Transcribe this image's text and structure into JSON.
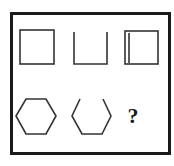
{
  "puzzle": {
    "question_mark": "?",
    "row1": [
      {
        "shape": "square",
        "variant": "closed"
      },
      {
        "shape": "square",
        "variant": "open-top"
      },
      {
        "shape": "square",
        "variant": "inner-left-line"
      }
    ],
    "row2": [
      {
        "shape": "hexagon",
        "variant": "closed"
      },
      {
        "shape": "hexagon",
        "variant": "open-top"
      },
      {
        "shape": "unknown",
        "variant": "question"
      }
    ],
    "colors": {
      "stroke": "#1a1a1a",
      "background": "#ffffff"
    }
  }
}
